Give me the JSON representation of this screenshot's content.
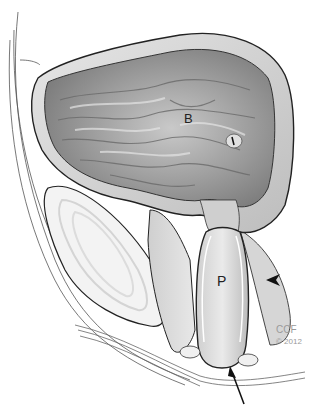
{
  "figure": {
    "type": "anatomical illustration",
    "labels": {
      "bladder": "B",
      "prostate": "P"
    },
    "credit": {
      "org": "CCF",
      "year": "© 2012"
    },
    "annotations": [
      {
        "kind": "arrowhead",
        "points_to": "prostate capsule (right side)"
      },
      {
        "kind": "arrow",
        "points_to": "prostatic apex"
      }
    ]
  }
}
